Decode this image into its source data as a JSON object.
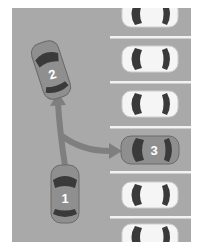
{
  "diagram": {
    "background_color": "#a9a9a9",
    "line_color": "#f2f2f2",
    "cars": [
      {
        "id": "car-1",
        "label": "1",
        "color": "#8f8f8f"
      },
      {
        "id": "car-2",
        "label": "2",
        "color": "#8f8f8f"
      },
      {
        "id": "car-3",
        "label": "3",
        "color": "#8f8f8f"
      }
    ],
    "parked_cars_color": "#f4f4f4",
    "arrows": [
      {
        "id": "arrow-straight",
        "from": "car-1",
        "to": "car-2"
      },
      {
        "id": "arrow-curved",
        "from": "car-1",
        "to": "car-3"
      }
    ]
  }
}
